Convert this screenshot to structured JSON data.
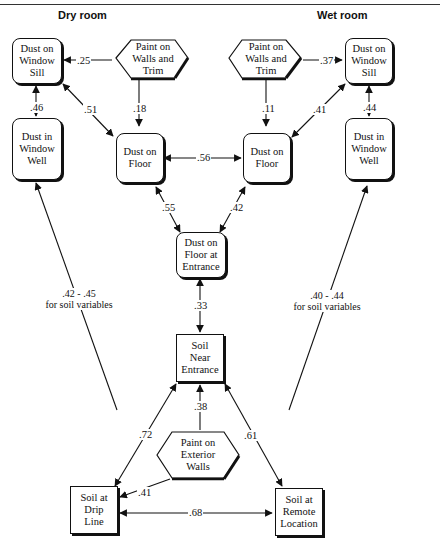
{
  "headings": {
    "left": "Dry room",
    "right": "Wet room"
  },
  "nodes": {
    "dry_window_sill": "Dust on Window Sill",
    "dry_paint": "Paint on Walls and Trim",
    "dry_window_well": "Dust in Window Well",
    "dry_floor": "Dust on Floor",
    "wet_paint": "Paint on Walls and Trim",
    "wet_window_sill": "Dust on Window Sill",
    "wet_floor": "Dust on Floor",
    "wet_window_well": "Dust in Window Well",
    "entrance_floor": "Dust on Floor at Entrance",
    "soil_entrance": "Soil Near Entrance",
    "exterior_paint": "Paint on Exterior Walls",
    "soil_drip": "Soil at Drip Line",
    "soil_remote": "Soil at Remote Location"
  },
  "node_lines": {
    "dry_window_sill": [
      "Dust on",
      "Window",
      "Sill"
    ],
    "dry_paint": [
      "Paint on",
      "Walls and",
      "Trim"
    ],
    "dry_window_well": [
      "Dust in",
      "Window",
      "Well"
    ],
    "dry_floor": [
      "Dust on",
      "Floor"
    ],
    "wet_paint": [
      "Paint on",
      "Walls and",
      "Trim"
    ],
    "wet_window_sill": [
      "Dust on",
      "Window",
      "Sill"
    ],
    "wet_floor": [
      "Dust on",
      "Floor"
    ],
    "wet_window_well": [
      "Dust in",
      "Window",
      "Well"
    ],
    "entrance_floor": [
      "Dust on",
      "Floor at",
      "Entrance"
    ],
    "soil_entrance": [
      "Soil",
      "Near",
      "Entrance"
    ],
    "exterior_paint": [
      "Paint on",
      "Exterior",
      "Walls"
    ],
    "soil_drip": [
      "Soil at",
      "Drip",
      "Line"
    ],
    "soil_remote": [
      "Soil at",
      "Remote",
      "Location"
    ]
  },
  "edges": [
    {
      "from": "dry_paint",
      "to": "dry_window_sill",
      "value": ".25",
      "type": "directed"
    },
    {
      "from": "dry_window_sill",
      "to": "dry_window_well",
      "value": ".46",
      "type": "bidirectional"
    },
    {
      "from": "dry_window_sill",
      "to": "dry_floor",
      "value": ".51",
      "type": "bidirectional"
    },
    {
      "from": "dry_paint",
      "to": "dry_floor",
      "value": ".18",
      "type": "directed"
    },
    {
      "from": "wet_paint",
      "to": "wet_window_sill",
      "value": ".37",
      "type": "directed"
    },
    {
      "from": "wet_paint",
      "to": "wet_floor",
      "value": ".11",
      "type": "directed"
    },
    {
      "from": "wet_window_sill",
      "to": "wet_floor",
      "value": ".41",
      "type": "bidirectional"
    },
    {
      "from": "wet_window_sill",
      "to": "wet_window_well",
      "value": ".44",
      "type": "bidirectional"
    },
    {
      "from": "dry_floor",
      "to": "wet_floor",
      "value": ".56",
      "type": "bidirectional"
    },
    {
      "from": "dry_floor",
      "to": "entrance_floor",
      "value": ".55",
      "type": "bidirectional"
    },
    {
      "from": "wet_floor",
      "to": "entrance_floor",
      "value": ".42",
      "type": "bidirectional"
    },
    {
      "from": "entrance_floor",
      "to": "soil_entrance",
      "value": ".33",
      "type": "bidirectional"
    },
    {
      "from": "exterior_paint",
      "to": "soil_entrance",
      "value": ".38",
      "type": "directed"
    },
    {
      "from": "soil_entrance",
      "to": "soil_drip",
      "value": ".72",
      "type": "bidirectional"
    },
    {
      "from": "soil_entrance",
      "to": "soil_remote",
      "value": ".61",
      "type": "bidirectional"
    },
    {
      "from": "exterior_paint",
      "to": "soil_drip",
      "value": ".41",
      "type": "directed"
    },
    {
      "from": "soil_drip",
      "to": "soil_remote",
      "value": ".68",
      "type": "bidirectional"
    },
    {
      "from": "soil_variables",
      "to": "dry_window_well",
      "value": ".42 - .45 for soil variables",
      "type": "directed"
    },
    {
      "from": "soil_variables",
      "to": "wet_window_well",
      "value": ".40 - .44 for soil variables",
      "type": "directed"
    }
  ],
  "coefficients": {
    "c25": ".25",
    "c46": ".46",
    "c51": ".51",
    "c18": ".18",
    "c37": ".37",
    "c11": ".11",
    "c41w": ".41",
    "c44": ".44",
    "c56": ".56",
    "c55": ".55",
    "c42": ".42",
    "c33": ".33",
    "c38": ".38",
    "c72": ".72",
    "c61": ".61",
    "c41e": ".41",
    "c68": ".68"
  },
  "notes": {
    "left_range": ".42 - .45",
    "left_sub": "for soil variables",
    "right_range": ".40 - .44",
    "right_sub": "for soil variables"
  }
}
